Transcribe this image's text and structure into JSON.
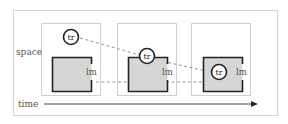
{
  "diagram": {
    "axes": {
      "vertical_label": "space",
      "horizontal_label": "time"
    },
    "panels": [
      {
        "tr_label": "tr",
        "lm_label": "lm"
      },
      {
        "tr_label": "tr",
        "lm_label": "lm"
      },
      {
        "tr_label": "tr",
        "lm_label": "lm"
      }
    ],
    "colors": {
      "frame": "#d4d4d4",
      "panel_border": "#cfcfcf",
      "square_fill": "#d6d6d6",
      "square_stroke": "#222222",
      "dashed_line": "#888888",
      "arrow": "#222222"
    }
  }
}
